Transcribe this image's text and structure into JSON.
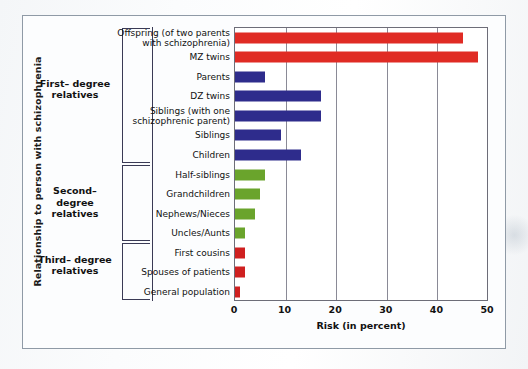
{
  "figure": {
    "y_axis_title": "Relationship to person with schizophrenia",
    "x_axis_title": "Risk (in percent)"
  },
  "groups": [
    {
      "label": "First–\ndegree\nrelatives",
      "name": "first-degree-relatives"
    },
    {
      "label": "Second–\ndegree\nrelatives",
      "name": "second-degree-relatives"
    },
    {
      "label": "Third–\ndegree\nrelatives",
      "name": "third-degree-relatives"
    }
  ],
  "x_ticks": [
    "0",
    "10",
    "20",
    "30",
    "40",
    "50"
  ],
  "colors": {
    "red_bright": "#e02b24",
    "blue": "#2e2c8c",
    "green": "#6aa42c",
    "red_dark": "#cf2020",
    "axis": "#6d6d78",
    "grid": "#8a8a96",
    "bracket": "#3a3a55",
    "text": "#111111",
    "frame": "#8f9aa6"
  },
  "chart_data": {
    "type": "bar",
    "orientation": "horizontal",
    "title": "",
    "xlabel": "Risk (in percent)",
    "ylabel": "Relationship to person with schizophrenia",
    "xlim": [
      0,
      50
    ],
    "xticks": [
      0,
      10,
      20,
      30,
      40,
      50
    ],
    "grid": true,
    "legend": "none",
    "categories": [
      "Offspring (of two parents\nwith schizophrenia)",
      "MZ twins",
      "Parents",
      "DZ twins",
      "Siblings (with one\nschizophrenic parent)",
      "Siblings",
      "Children",
      "Half-siblings",
      "Grandchildren",
      "Nephews/Nieces",
      "Uncles/Aunts",
      "First cousins",
      "Spouses  of patients",
      "General population"
    ],
    "values": [
      45,
      48,
      6,
      17,
      17,
      9,
      13,
      6,
      5,
      4,
      2,
      2,
      2,
      1
    ],
    "bar_colors": [
      "#e02b24",
      "#e02b24",
      "#2e2c8c",
      "#2e2c8c",
      "#2e2c8c",
      "#2e2c8c",
      "#2e2c8c",
      "#6aa42c",
      "#6aa42c",
      "#6aa42c",
      "#6aa42c",
      "#cf2020",
      "#cf2020",
      "#cf2020"
    ],
    "groups": [
      {
        "name": "First–degree relatives",
        "from": 0,
        "to": 6
      },
      {
        "name": "Second–degree relatives",
        "from": 7,
        "to": 10
      },
      {
        "name": "Third–degree relatives",
        "from": 11,
        "to": 13
      }
    ]
  }
}
